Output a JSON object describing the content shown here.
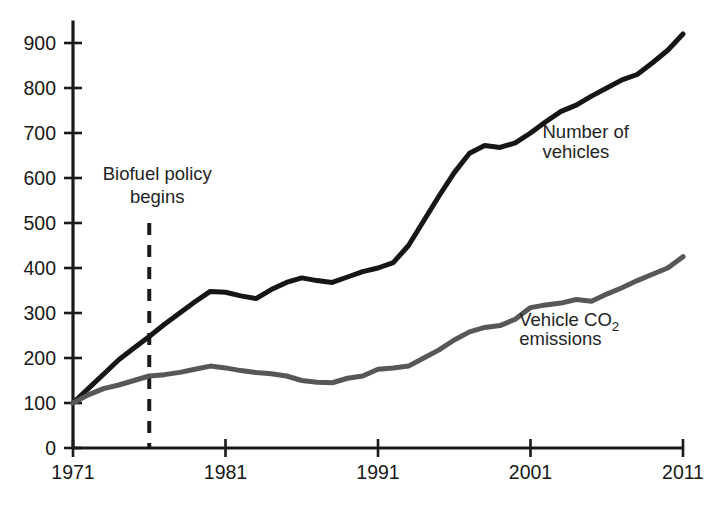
{
  "chart_data": {
    "type": "line",
    "title": "",
    "subtitle": "",
    "xlabel": "",
    "ylabel": "",
    "xlim": [
      1971,
      2011
    ],
    "ylim": [
      0,
      950
    ],
    "grid": false,
    "legend_position": "inline-annotations",
    "y_ticks": [
      "0",
      "100",
      "200",
      "300",
      "400",
      "500",
      "600",
      "700",
      "800",
      "900"
    ],
    "y_tick_values": [
      0,
      100,
      200,
      300,
      400,
      500,
      600,
      700,
      800,
      900
    ],
    "x_ticks": [
      "1971",
      "1981",
      "1991",
      "2001",
      "2011"
    ],
    "x_tick_values": [
      1971,
      1981,
      1991,
      2001,
      2011
    ],
    "x": [
      1971,
      1972,
      1973,
      1974,
      1975,
      1976,
      1977,
      1978,
      1979,
      1980,
      1981,
      1982,
      1983,
      1984,
      1985,
      1986,
      1987,
      1988,
      1989,
      1990,
      1991,
      1992,
      1993,
      1994,
      1995,
      1996,
      1997,
      1998,
      1999,
      2000,
      2001,
      2002,
      2003,
      2004,
      2005,
      2006,
      2007,
      2008,
      2009,
      2010,
      2011
    ],
    "series": [
      {
        "name": "Number of vehicles",
        "color": "#161616",
        "label_line1": "Number of",
        "label_line2": "vehicles",
        "values": [
          100,
          132,
          164,
          196,
          222,
          248,
          275,
          300,
          325,
          348,
          346,
          338,
          332,
          352,
          368,
          378,
          372,
          368,
          380,
          392,
          400,
          412,
          450,
          505,
          560,
          612,
          655,
          672,
          668,
          678,
          700,
          725,
          748,
          762,
          782,
          800,
          818,
          830,
          856,
          884,
          920
        ]
      },
      {
        "name": "Vehicle CO2 emissions",
        "color": "#575757",
        "label_line1": "Vehicle CO",
        "label_sub": "2",
        "label_line2": "emissions",
        "values": [
          100,
          118,
          132,
          140,
          150,
          160,
          163,
          168,
          175,
          182,
          178,
          172,
          168,
          165,
          160,
          150,
          146,
          145,
          155,
          160,
          175,
          178,
          182,
          200,
          218,
          240,
          258,
          268,
          272,
          286,
          312,
          318,
          322,
          330,
          326,
          342,
          356,
          372,
          386,
          400,
          425
        ]
      }
    ],
    "annotations": [
      {
        "name": "biofuel-policy",
        "line1": "Biofuel policy",
        "line2": "begins",
        "x_value": 1976,
        "style": "dashed-vertical-line",
        "color": "#1a1a1a"
      }
    ]
  },
  "figure": {
    "background": "#ffffff",
    "axis_color": "#1a1a1a",
    "caption_partial": ""
  }
}
